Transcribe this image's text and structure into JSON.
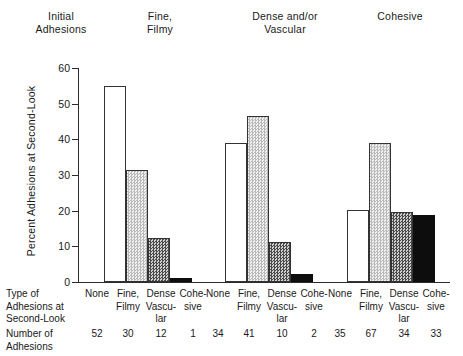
{
  "chart_data": {
    "type": "bar",
    "title": "",
    "xlabel": "Type of Adhesions at Second-Look",
    "ylabel": "Percent Adhesions at Second-Look",
    "ylim": [
      0,
      60
    ],
    "yticks": [
      0,
      10,
      20,
      30,
      40,
      50,
      60
    ],
    "grid": false,
    "legend_position": "none",
    "group_axis_title": "Initial Adhesions",
    "groups": [
      {
        "label": "Fine,\nFilmy",
        "categories": [
          "None",
          "Fine,\nFilmy",
          "Dense\nVascu-\nlar",
          "Cohe-\nsive"
        ],
        "values": [
          55,
          31.5,
          12.3,
          1.1
        ],
        "counts": [
          52,
          30,
          12,
          1
        ]
      },
      {
        "label": "Dense and/or\nVascular",
        "categories": [
          "None",
          "Fine,\nFilmy",
          "Dense\nVascu-\nlar",
          "Cohe-\nsive"
        ],
        "values": [
          39,
          46.5,
          11.2,
          2.3
        ],
        "counts": [
          34,
          41,
          10,
          2
        ]
      },
      {
        "label": "Cohesive",
        "categories": [
          "None",
          "Fine,\nFilmy",
          "Dense\nVascu-\nlar",
          "Cohe-\nsive"
        ],
        "values": [
          20.2,
          39,
          19.6,
          18.8
        ],
        "counts": [
          35,
          67,
          34,
          33
        ]
      }
    ],
    "series_fills": [
      "white",
      "light-checker",
      "dark-checker",
      "solid-black"
    ]
  },
  "axis": {
    "y_title": "Percent Adhesions at Second-Look",
    "tick_60": "60",
    "tick_50": "50",
    "tick_40": "40",
    "tick_30": "30",
    "tick_20": "20",
    "tick_10": "10",
    "tick_0": "0"
  },
  "top": {
    "initial_header": "Initial\nAdhesions",
    "group1_header": "Fine,\nFilmy",
    "group2_header": "Dense and/or\nVascular",
    "group3_header": "Cohesive"
  },
  "bottom": {
    "type_row_label": "Type of\nAdhesions at\nSecond-Look",
    "number_row_label": "Number of\nAdhesions",
    "cat_none": "None",
    "cat_fine": "Fine,\nFilmy",
    "cat_dense": "Dense\nVascu-\nlar",
    "cat_cohesive": "Cohe-\nsive",
    "g1_n1": "52",
    "g1_n2": "30",
    "g1_n3": "12",
    "g1_n4": "1",
    "g2_n1": "34",
    "g2_n2": "41",
    "g2_n3": "10",
    "g2_n4": "2",
    "g3_n1": "35",
    "g3_n2": "67",
    "g3_n3": "34",
    "g3_n4": "33"
  },
  "colors": {
    "axis": "#2b2b2b",
    "text": "#1a1a1a",
    "bar_outline": "#333333",
    "bar_none": "#ffffff",
    "bar_cohesive": "#0d0d0d"
  }
}
